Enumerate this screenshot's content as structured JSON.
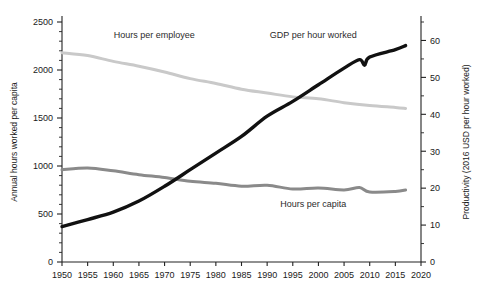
{
  "chart_data": {
    "type": "line",
    "title": "",
    "xlabel": "",
    "ylabel": "Annual hours worked per capita",
    "y2label": "Productivity (2016 USD per hour worked)",
    "xlim": [
      1950,
      2020
    ],
    "ylim": [
      0,
      2500
    ],
    "y2lim": [
      0,
      65
    ],
    "grid": false,
    "legend_position": "inline-annotations",
    "xticks": [
      1950,
      1955,
      1960,
      1965,
      1970,
      1975,
      1980,
      1985,
      1990,
      1995,
      2000,
      2005,
      2010,
      2015,
      2020
    ],
    "xtick_labels": [
      "1950",
      "1955",
      "1960",
      "1965",
      "1970",
      "1975",
      "1980",
      "1985",
      "1990",
      "1995",
      "2000",
      "2005",
      "2010",
      "2015",
      "2020"
    ],
    "yticks": [
      0,
      500,
      1000,
      1500,
      2000,
      2500
    ],
    "ytick_labels": [
      "0",
      "500",
      "1000",
      "1500",
      "2000",
      "2500"
    ],
    "y_minor_step": 100,
    "y2ticks": [
      0,
      10,
      20,
      30,
      40,
      50,
      60
    ],
    "y2tick_labels": [
      "0",
      "10",
      "20",
      "30",
      "40",
      "50",
      "60"
    ],
    "y2_minor_step": 5,
    "series": [
      {
        "name": "Hours per employee",
        "axis": "left",
        "color": "#c9c9c9",
        "width": 3.0,
        "label_x": 1968,
        "label_y": 2330,
        "x": [
          1950,
          1955,
          1960,
          1965,
          1970,
          1975,
          1980,
          1985,
          1990,
          1995,
          2000,
          2005,
          2010,
          2015,
          2017
        ],
        "values": [
          2180,
          2150,
          2090,
          2040,
          1980,
          1910,
          1860,
          1800,
          1760,
          1720,
          1700,
          1660,
          1630,
          1610,
          1600
        ]
      },
      {
        "name": "Hours per capita",
        "axis": "left",
        "color": "#8a8a8a",
        "width": 3.0,
        "label_x": 1999,
        "label_y": 570,
        "x": [
          1950,
          1955,
          1960,
          1965,
          1970,
          1975,
          1980,
          1985,
          1990,
          1995,
          2000,
          2005,
          2008,
          2010,
          2015,
          2017
        ],
        "values": [
          960,
          980,
          950,
          910,
          880,
          840,
          820,
          790,
          800,
          760,
          770,
          750,
          775,
          730,
          735,
          750
        ]
      },
      {
        "name": "GDP per hour worked",
        "axis": "right",
        "color": "#111111",
        "width": 3.4,
        "label_x": 1999,
        "label_y": 2330,
        "x": [
          1950,
          1955,
          1960,
          1965,
          1970,
          1975,
          1980,
          1985,
          1990,
          1995,
          2000,
          2005,
          2008,
          2009,
          2010,
          2015,
          2017
        ],
        "values": [
          9.6,
          11.5,
          13.5,
          16.5,
          20.5,
          25.0,
          29.5,
          34.0,
          39.5,
          43.5,
          48.0,
          52.5,
          54.8,
          53.3,
          55.5,
          57.5,
          58.6
        ]
      }
    ]
  }
}
